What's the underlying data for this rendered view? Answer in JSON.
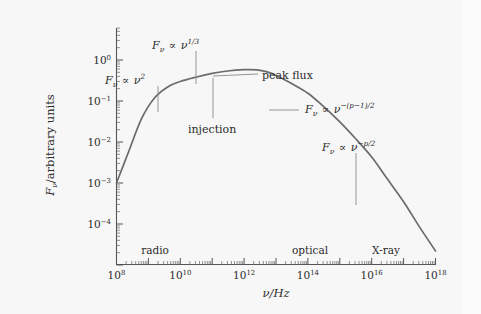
{
  "chart_data": {
    "type": "line",
    "title": "",
    "xlabel": "ν/Hz",
    "ylabel": "Fν/arbitrary units",
    "xscale": "log",
    "yscale": "log",
    "xlim": [
      100000000.0,
      1e+18
    ],
    "ylim": [
      1e-05,
      3.0
    ],
    "grid": false,
    "legend_position": "none",
    "x_tick_labels": [
      "10^8",
      "10^10",
      "10^12",
      "10^14",
      "10^16",
      "10^18"
    ],
    "x_tick_values": [
      100000000.0,
      10000000000.0,
      1000000000000.0,
      100000000000000.0,
      1e+16,
      1e+18
    ],
    "y_tick_labels": [
      "10^0",
      "10^-1",
      "10^-2",
      "10^-3",
      "10^-4"
    ],
    "y_tick_values": [
      1,
      0.1,
      0.01,
      0.001,
      0.0001
    ],
    "series": [
      {
        "name": "synchrotron spectrum",
        "color": "#6b6b6b",
        "x": [
          100000000.0,
          250000000.0,
          600000000.0,
          1500000000.0,
          4000000000.0,
          10000000000.0,
          30000000000.0,
          100000000000.0,
          300000000000.0,
          1000000000000.0,
          2500000000000.0,
          5000000000000.0,
          10000000000000.0,
          30000000000000.0,
          100000000000000.0,
          300000000000000.0,
          1000000000000000.0,
          3000000000000000.0,
          1e+16,
          3e+16,
          1e+17,
          3e+17,
          1e+18
        ],
        "y": [
          0.001,
          0.0063,
          0.036,
          0.115,
          0.22,
          0.3,
          0.38,
          0.47,
          0.54,
          0.58,
          0.575,
          0.52,
          0.42,
          0.27,
          0.155,
          0.075,
          0.031,
          0.0125,
          0.0043,
          0.0013,
          0.00035,
          9e-05,
          2.2e-05
        ]
      }
    ],
    "annotations": [
      {
        "id": "nu2",
        "text_html": "F<sub>ν</sub> ∝ ν<sup>2</sup>",
        "plain": "F_nu ∝ nu^2",
        "label_x": 105,
        "label_y": 75,
        "leader": [
          [
            158,
            86
          ],
          [
            158,
            112
          ]
        ]
      },
      {
        "id": "nu13",
        "text_html": "F<sub>ν</sub> ∝ ν<sup>1/3</sup>",
        "plain": "F_nu ∝ nu^(1/3)",
        "label_x": 152,
        "label_y": 40,
        "leader": [
          [
            196,
            51
          ],
          [
            196,
            84
          ]
        ]
      },
      {
        "id": "peak-flux",
        "text_html": "peak flux",
        "plain": "peak flux",
        "label_x": 262,
        "label_y": 70,
        "leader": [
          [
            258,
            74
          ],
          [
            213,
            76
          ]
        ]
      },
      {
        "id": "injection",
        "text_html": "injection",
        "plain": "injection",
        "label_x": 188,
        "label_y": 124,
        "leader": [
          [
            213,
            78
          ],
          [
            213,
            118
          ]
        ]
      },
      {
        "id": "nu-p1-2",
        "text_html": "F<sub>ν</sub> ∝ ν<sup>−(p−1)/2</sup>",
        "plain": "F_nu ∝ nu^(-(p-1)/2)",
        "label_x": 305,
        "label_y": 104,
        "leader": [
          [
            299,
            110
          ],
          [
            269,
            110
          ]
        ]
      },
      {
        "id": "nu-p-2",
        "text_html": "F<sub>ν</sub> ∝ ν<sup>−p/2</sup>",
        "plain": "F_nu ∝ nu^(-p/2)",
        "label_x": 322,
        "label_y": 142,
        "leader": [
          [
            356,
            153
          ],
          [
            356,
            205
          ]
        ]
      }
    ],
    "band_labels": [
      {
        "text": "radio",
        "x": 155,
        "y": 245
      },
      {
        "text": "optical",
        "x": 310,
        "y": 245
      },
      {
        "text": "X-ray",
        "x": 386,
        "y": 245
      }
    ]
  },
  "axes": {
    "x_title": "ν/Hz",
    "y_title_prefix": "F",
    "y_title_sub": "ν",
    "y_title_rest": "/arbitrary units",
    "x_ticks": [
      {
        "mantissa": "10",
        "exp": "8"
      },
      {
        "mantissa": "10",
        "exp": "10"
      },
      {
        "mantissa": "10",
        "exp": "12"
      },
      {
        "mantissa": "10",
        "exp": "14"
      },
      {
        "mantissa": "10",
        "exp": "16"
      },
      {
        "mantissa": "10",
        "exp": "18"
      }
    ],
    "y_ticks": [
      {
        "mantissa": "10",
        "exp": "0"
      },
      {
        "mantissa": "10",
        "exp": "−1"
      },
      {
        "mantissa": "10",
        "exp": "−2"
      },
      {
        "mantissa": "10",
        "exp": "−3"
      },
      {
        "mantissa": "10",
        "exp": "−4"
      }
    ]
  },
  "colors": {
    "curve": "#6b6b6b",
    "axis": "#555555",
    "text": "#2b2b2b",
    "background": "#f7f7f7",
    "outer_background": "#fdfdfd"
  },
  "annotation_text": {
    "nu2_base": "F",
    "nu2_sub": "ν",
    "prop": "∝",
    "nu": "ν",
    "exp_2": "2",
    "exp_13": "1/3",
    "exp_p1": "−(p−1)/2",
    "exp_p": "−p/2",
    "peak_flux": "peak flux",
    "injection": "injection",
    "radio": "radio",
    "optical": "optical",
    "xray": "X-ray"
  }
}
